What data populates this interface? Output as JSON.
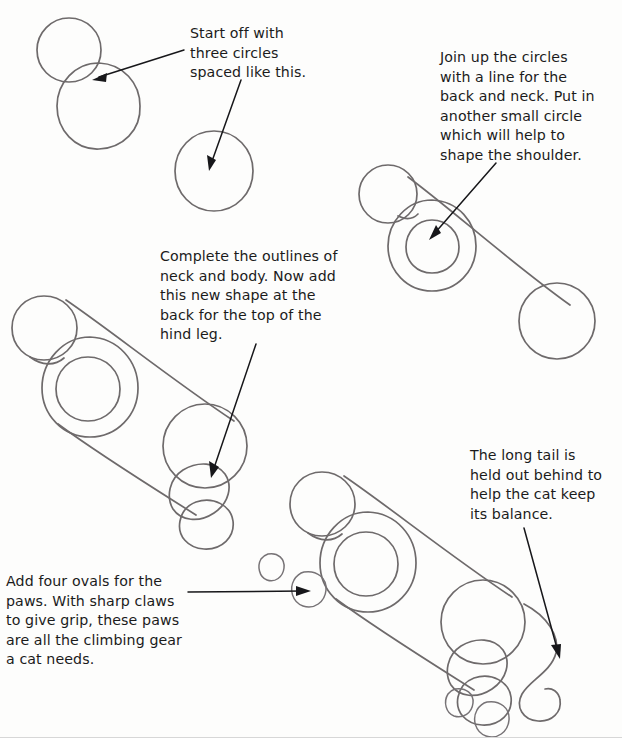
{
  "page": {
    "kind": "how-to-draw-tutorial-page",
    "subject": "cat",
    "background_color": "#fdfdfc",
    "pencil_color": "#6e6a6b",
    "ink_color": "#17171a",
    "width": 622,
    "height": 738
  },
  "captions": [
    {
      "id": "caption-1",
      "text": "Start off with\nthree circles\nspaced like this.",
      "step": 1
    },
    {
      "id": "caption-2",
      "text": "Join up the circles\nwith a line for the\nback and neck. Put in\nanother small circle\nwhich will help to\nshape the shoulder.",
      "step": 2
    },
    {
      "id": "caption-3",
      "text": "Complete the outlines of\nneck and body. Now add\nthis new shape at the\nback for the top of the\nhind leg.",
      "step": 3
    },
    {
      "id": "caption-4",
      "text": "The long tail is\nheld out behind to\nhelp the cat keep\nits balance.",
      "step": 4
    },
    {
      "id": "caption-5",
      "text": "Add four ovals for the\npaws. With sharp claws\nto give grip, these paws\nare all the climbing gear\na cat needs.",
      "step": 5
    }
  ],
  "figures": [
    {
      "id": "figure-1",
      "label": "three-circles-step",
      "parts": [
        "head-circle",
        "body-circle",
        "hindquarters-circle"
      ]
    },
    {
      "id": "figure-2",
      "label": "joined-circles-step",
      "parts": [
        "head-circle",
        "body-circle",
        "shoulder-circle",
        "hindquarters-circle",
        "back-line",
        "neck-line"
      ]
    },
    {
      "id": "figure-3",
      "label": "outlined-body-step",
      "parts": [
        "head-circle",
        "body-circle",
        "shoulder-circle",
        "hindquarters-circle",
        "back-line",
        "belly-line",
        "hind-leg-shape"
      ]
    },
    {
      "id": "figure-4",
      "label": "paws-and-tail-step",
      "parts": [
        "head-circle",
        "body-circle",
        "shoulder-circle",
        "hindquarters-circle",
        "back-line",
        "belly-line",
        "hind-leg-shape",
        "tail-curve",
        "paw-oval-1",
        "paw-oval-2",
        "paw-oval-3",
        "paw-oval-4"
      ]
    }
  ],
  "arrows": [
    {
      "id": "arrow-1",
      "from_caption": "caption-1",
      "points_to": "figure-1-body-circle"
    },
    {
      "id": "arrow-2",
      "from_caption": "caption-1",
      "points_to": "figure-1-hindquarters-circle"
    },
    {
      "id": "arrow-3",
      "from_caption": "caption-2",
      "points_to": "figure-2-shoulder-circle"
    },
    {
      "id": "arrow-4",
      "from_caption": "caption-3",
      "points_to": "figure-3-hind-leg-shape"
    },
    {
      "id": "arrow-5",
      "from_caption": "caption-4",
      "points_to": "figure-4-tail-curve"
    },
    {
      "id": "arrow-6",
      "from_caption": "caption-5",
      "points_to": "figure-4-paw-oval"
    }
  ]
}
